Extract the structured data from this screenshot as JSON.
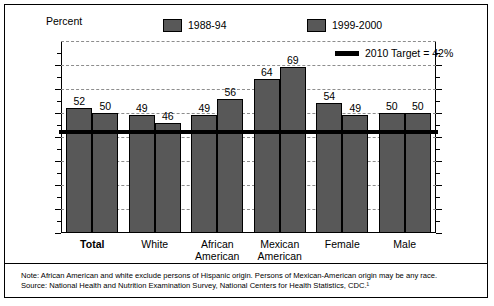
{
  "axis_label": "Percent",
  "legend": [
    {
      "name": "series-1988-94",
      "label": "1988-94",
      "type": "swatch",
      "color": "#585858"
    },
    {
      "name": "series-1999-2000",
      "label": "1999-2000",
      "type": "swatch",
      "color": "#585858"
    },
    {
      "name": "target-line",
      "label": "2010 Target = 42%",
      "type": "line",
      "color": "#000000"
    }
  ],
  "y_ticks": [
    "0",
    "10",
    "20",
    "30",
    "40",
    "50",
    "60",
    "70",
    "80"
  ],
  "categories": [
    "Total",
    "White",
    "African American",
    "Mexican American",
    "Female",
    "Male"
  ],
  "notes": {
    "line1": "Note: African American and white exclude persons of Hispanic origin. Persons of Mexican-American origin may be any race.",
    "line2": "Source: National Health and Nutrition Examination Survey, National Centers for Health Statistics, CDC.¹"
  },
  "chart_data": {
    "type": "bar",
    "title": "",
    "subtitle": "",
    "xlabel": "",
    "ylabel": "Percent",
    "ylim": [
      0,
      80
    ],
    "ytick_step": 10,
    "grid": true,
    "legend_position": "top",
    "categories": [
      "Total",
      "White",
      "African American",
      "Mexican American",
      "Female",
      "Male"
    ],
    "series": [
      {
        "name": "1988-94",
        "color": "#585858",
        "values": [
          52,
          49,
          49,
          64,
          54,
          50
        ]
      },
      {
        "name": "1999-2000",
        "color": "#585858",
        "values": [
          50,
          46,
          56,
          69,
          49,
          50
        ]
      }
    ],
    "reference_line": {
      "label": "2010 Target = 42%",
      "value": 42,
      "color": "#000000"
    },
    "annotations": [
      "Note: African American and white exclude persons of Hispanic origin. Persons of Mexican-American origin may be any race.",
      "Source: National Health and Nutrition Examination Survey, National Centers for Health Statistics, CDC.¹"
    ]
  }
}
